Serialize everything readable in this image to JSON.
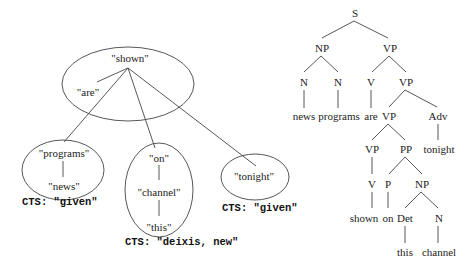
{
  "dependency_diagram": {
    "nodes": {
      "shown": "\"shown\"",
      "are": "\"are\"",
      "programs": "\"programs\"",
      "news": "\"news\"",
      "on": "\"on\"",
      "channel": "\"channel\"",
      "this": "\"this\"",
      "tonight": "\"tonight\""
    },
    "cts_labels": {
      "programs_group": "CTS: \"given\"",
      "on_group": "CTS: \"deixis, new\"",
      "tonight_group": "CTS: \"given\""
    }
  },
  "parse_tree": {
    "S": "S",
    "NP": "NP",
    "VP": "VP",
    "N1": "N",
    "N2": "N",
    "V": "V",
    "VP2": "VP",
    "news": "news",
    "programs": "programs",
    "are": "are",
    "VP3": "VP",
    "Adv": "Adv",
    "VP4": "VP",
    "PP": "PP",
    "tonight": "tonight",
    "V2": "V",
    "P": "P",
    "NP2": "NP",
    "shown": "shown",
    "on": "on",
    "Det": "Det",
    "N3": "N",
    "this": "this",
    "channel": "channel"
  }
}
